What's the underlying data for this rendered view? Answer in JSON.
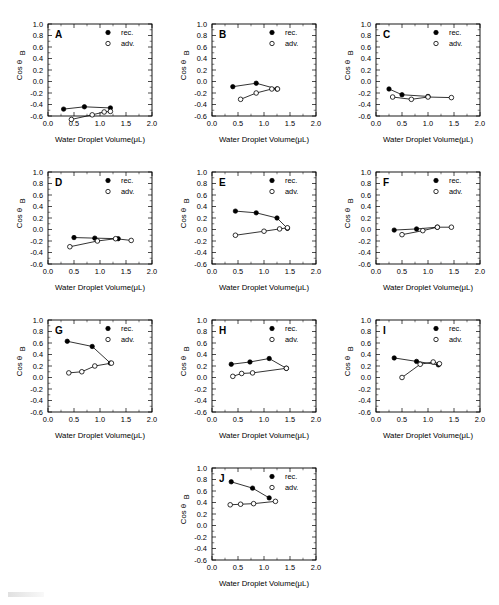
{
  "figure": {
    "panel_count": 10,
    "axis": {
      "xlabel": "Water Droplet Volume(μL)",
      "ylabel": "Cos θB",
      "ylabel_main": "Cos θ",
      "ylabel_sub": "B",
      "xlim": [
        0.0,
        2.0
      ],
      "ylim": [
        -0.6,
        1.0
      ],
      "xticks": [
        "0.0",
        "0.5",
        "1.0",
        "1.5",
        "2.0"
      ],
      "xtick_values": [
        0.0,
        0.5,
        1.0,
        1.5,
        2.0
      ],
      "yticks": [
        "1.0",
        "0.8",
        "0.6",
        "0.4",
        "0.2",
        "0.0",
        "-0.2",
        "-0.4",
        "-0.6"
      ],
      "ytick_values": [
        1.0,
        0.8,
        0.6,
        0.4,
        0.2,
        0.0,
        -0.2,
        -0.4,
        -0.6
      ],
      "grid": false
    },
    "legend": {
      "position": "top-right",
      "entries": [
        {
          "label": "rec.",
          "marker": "filled-circle",
          "color": "#000000"
        },
        {
          "label": "adv.",
          "marker": "open-circle",
          "color": "#000000"
        }
      ]
    }
  },
  "chart_data": [
    {
      "type": "scatter",
      "panel": "A",
      "title": "A",
      "xlabel": "Water Droplet Volume(μL)",
      "ylabel": "Cos θB",
      "xlim": [
        0.0,
        2.0
      ],
      "ylim": [
        -0.6,
        1.0
      ],
      "series": [
        {
          "name": "rec.",
          "x": [
            0.3,
            0.7,
            1.2
          ],
          "y": [
            -0.48,
            -0.44,
            -0.46
          ]
        },
        {
          "name": "adv.",
          "x": [
            0.45,
            0.85,
            1.08,
            1.2
          ],
          "y": [
            -0.66,
            -0.58,
            -0.53,
            -0.52
          ]
        }
      ]
    },
    {
      "type": "scatter",
      "panel": "B",
      "title": "B",
      "xlabel": "Water Droplet Volume(μL)",
      "ylabel": "Cos θB",
      "xlim": [
        0.0,
        2.0
      ],
      "ylim": [
        -0.6,
        1.0
      ],
      "series": [
        {
          "name": "rec.",
          "x": [
            0.4,
            0.85,
            1.25
          ],
          "y": [
            -0.09,
            -0.03,
            -0.13
          ]
        },
        {
          "name": "adv.",
          "x": [
            0.55,
            0.85,
            1.15,
            1.26
          ],
          "y": [
            -0.31,
            -0.2,
            -0.13,
            -0.13
          ]
        }
      ]
    },
    {
      "type": "scatter",
      "panel": "C",
      "title": "C",
      "xlabel": "Water Droplet Volume(μL)",
      "ylabel": "Cos θB",
      "xlim": [
        0.0,
        2.0
      ],
      "ylim": [
        -0.6,
        1.0
      ],
      "series": [
        {
          "name": "rec.",
          "x": [
            0.25,
            0.5,
            1.0
          ],
          "y": [
            -0.13,
            -0.23,
            -0.26
          ]
        },
        {
          "name": "adv.",
          "x": [
            0.32,
            0.68,
            1.0,
            1.45
          ],
          "y": [
            -0.27,
            -0.31,
            -0.27,
            -0.28
          ]
        }
      ]
    },
    {
      "type": "scatter",
      "panel": "D",
      "title": "D",
      "xlabel": "Water Droplet Volume(μL)",
      "ylabel": "Cos θB",
      "xlim": [
        0.0,
        2.0
      ],
      "ylim": [
        -0.6,
        1.0
      ],
      "series": [
        {
          "name": "rec.",
          "x": [
            0.5,
            0.9,
            1.35
          ],
          "y": [
            -0.14,
            -0.15,
            -0.16
          ]
        },
        {
          "name": "adv.",
          "x": [
            0.42,
            0.95,
            1.3,
            1.6
          ],
          "y": [
            -0.3,
            -0.2,
            -0.16,
            -0.19
          ]
        }
      ]
    },
    {
      "type": "scatter",
      "panel": "E",
      "title": "E",
      "xlabel": "Water Droplet Volume(μL)",
      "ylabel": "Cos θB",
      "xlim": [
        0.0,
        2.0
      ],
      "ylim": [
        -0.6,
        1.0
      ],
      "series": [
        {
          "name": "rec.",
          "x": [
            0.45,
            0.85,
            1.25,
            1.45
          ],
          "y": [
            0.32,
            0.29,
            0.2,
            0.02
          ]
        },
        {
          "name": "adv.",
          "x": [
            0.45,
            1.0,
            1.3,
            1.45
          ],
          "y": [
            -0.1,
            -0.03,
            0.01,
            0.03
          ]
        }
      ]
    },
    {
      "type": "scatter",
      "panel": "F",
      "title": "F",
      "xlabel": "Water Droplet Volume(μL)",
      "ylabel": "Cos θB",
      "xlim": [
        0.0,
        2.0
      ],
      "ylim": [
        -0.6,
        1.0
      ],
      "series": [
        {
          "name": "rec.",
          "x": [
            0.35,
            0.78,
            1.18
          ],
          "y": [
            -0.01,
            0.01,
            0.04
          ]
        },
        {
          "name": "adv.",
          "x": [
            0.5,
            0.9,
            1.18,
            1.45
          ],
          "y": [
            -0.09,
            -0.02,
            0.04,
            0.04
          ]
        }
      ]
    },
    {
      "type": "scatter",
      "panel": "G",
      "title": "G",
      "xlabel": "Water Droplet Volume(μL)",
      "ylabel": "Cos θB",
      "xlim": [
        0.0,
        2.0
      ],
      "ylim": [
        -0.6,
        1.0
      ],
      "series": [
        {
          "name": "rec.",
          "x": [
            0.37,
            0.85,
            1.2
          ],
          "y": [
            0.63,
            0.54,
            0.25
          ]
        },
        {
          "name": "adv.",
          "x": [
            0.4,
            0.65,
            0.9,
            1.22
          ],
          "y": [
            0.08,
            0.1,
            0.2,
            0.25
          ]
        }
      ]
    },
    {
      "type": "scatter",
      "panel": "H",
      "title": "H",
      "xlabel": "Water Droplet Volume(μL)",
      "ylabel": "Cos θB",
      "xlim": [
        0.0,
        2.0
      ],
      "ylim": [
        -0.6,
        1.0
      ],
      "series": [
        {
          "name": "rec.",
          "x": [
            0.37,
            0.73,
            1.1,
            1.43
          ],
          "y": [
            0.23,
            0.27,
            0.33,
            0.16
          ]
        },
        {
          "name": "adv.",
          "x": [
            0.4,
            0.57,
            0.78,
            1.43
          ],
          "y": [
            0.02,
            0.07,
            0.08,
            0.16
          ]
        }
      ]
    },
    {
      "type": "scatter",
      "panel": "I",
      "title": "I",
      "xlabel": "Water Droplet Volume(μL)",
      "ylabel": "Cos θB",
      "xlim": [
        0.0,
        2.0
      ],
      "ylim": [
        -0.6,
        1.0
      ],
      "series": [
        {
          "name": "rec.",
          "x": [
            0.35,
            0.78,
            1.2
          ],
          "y": [
            0.34,
            0.28,
            0.22
          ]
        },
        {
          "name": "adv.",
          "x": [
            0.5,
            0.85,
            1.1,
            1.22
          ],
          "y": [
            0.0,
            0.23,
            0.27,
            0.24
          ]
        }
      ]
    },
    {
      "type": "scatter",
      "panel": "J",
      "title": "J",
      "xlabel": "Water Droplet Volume(μL)",
      "ylabel": "Cos θB",
      "xlim": [
        0.0,
        2.0
      ],
      "ylim": [
        -0.6,
        1.0
      ],
      "series": [
        {
          "name": "rec.",
          "x": [
            0.37,
            0.78,
            1.1
          ],
          "y": [
            0.76,
            0.65,
            0.48
          ]
        },
        {
          "name": "adv.",
          "x": [
            0.35,
            0.55,
            0.8,
            1.22
          ],
          "y": [
            0.36,
            0.37,
            0.38,
            0.42
          ]
        }
      ]
    }
  ],
  "layout": {
    "columns": 3,
    "panel_positions": [
      {
        "panel": "A",
        "left": 4,
        "top": 10
      },
      {
        "panel": "B",
        "left": 168,
        "top": 10
      },
      {
        "panel": "C",
        "left": 332,
        "top": 10
      },
      {
        "panel": "D",
        "left": 4,
        "top": 158
      },
      {
        "panel": "E",
        "left": 168,
        "top": 158
      },
      {
        "panel": "F",
        "left": 332,
        "top": 158
      },
      {
        "panel": "G",
        "left": 4,
        "top": 306
      },
      {
        "panel": "H",
        "left": 168,
        "top": 306
      },
      {
        "panel": "I",
        "left": 332,
        "top": 306
      },
      {
        "panel": "J",
        "left": 168,
        "top": 454
      }
    ]
  }
}
